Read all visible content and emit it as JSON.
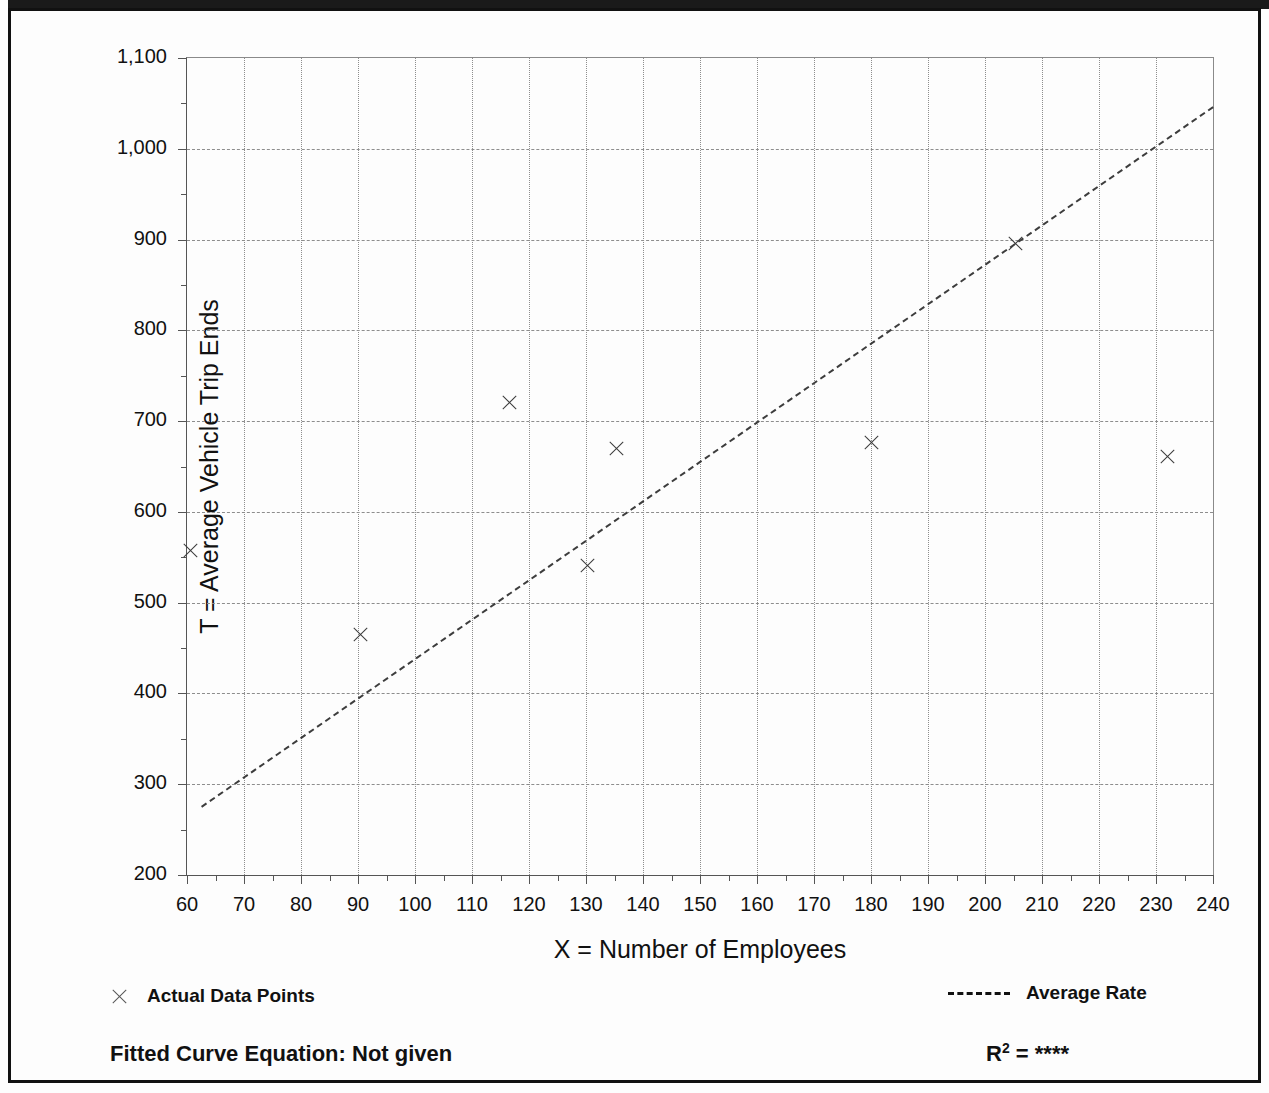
{
  "chart_data": {
    "type": "scatter",
    "title": "",
    "xlabel": "X = Number of Employees",
    "ylabel": "T = Average Vehicle Trip Ends",
    "xlim": [
      60,
      240
    ],
    "ylim": [
      200,
      1100
    ],
    "xticks": [
      60,
      70,
      80,
      90,
      100,
      110,
      120,
      130,
      140,
      150,
      160,
      170,
      180,
      190,
      200,
      210,
      220,
      230,
      240
    ],
    "yticks": [
      200,
      300,
      400,
      500,
      600,
      700,
      800,
      900,
      1000,
      1100
    ],
    "ytick_labels": [
      "200",
      "300",
      "400",
      "500",
      "600",
      "700",
      "800",
      "900",
      "1,000",
      "1,100"
    ],
    "xtick_labels": [
      "60",
      "70",
      "80",
      "90",
      "100",
      "110",
      "120",
      "130",
      "140",
      "150",
      "160",
      "170",
      "180",
      "190",
      "200",
      "210",
      "220",
      "230",
      "240"
    ],
    "y_minor_tick_step": 50,
    "x_minor_tick_step": 5,
    "grid": true,
    "grid_style": "dotted",
    "legend_position": "below-axes",
    "series": [
      {
        "name": "Actual Data Points",
        "type": "scatter",
        "marker": "x",
        "color": "#3a3a3a",
        "points": [
          {
            "x": 60.7,
            "y": 558
          },
          {
            "x": 90.5,
            "y": 466
          },
          {
            "x": 116.5,
            "y": 721
          },
          {
            "x": 130.3,
            "y": 542
          },
          {
            "x": 135.3,
            "y": 670
          },
          {
            "x": 180.0,
            "y": 677
          },
          {
            "x": 205.3,
            "y": 896
          },
          {
            "x": 232.0,
            "y": 662
          }
        ]
      },
      {
        "name": "Average Rate",
        "type": "line",
        "style": "dashed",
        "color": "#3d3d3d",
        "endpoints": [
          {
            "x": 62.5,
            "y": 276
          },
          {
            "x": 240.0,
            "y": 1047
          }
        ]
      }
    ]
  },
  "axes": {
    "y_title": "T = Average Vehicle Trip Ends",
    "x_title": "X = Number of Employees"
  },
  "legend": {
    "actual_label": "Actual Data Points",
    "average_label": "Average Rate",
    "actual_marker_icon": "x-marker-icon",
    "average_line_icon": "dashed-line-icon"
  },
  "footnotes": {
    "equation_label": "Fitted Curve Equation:  Not given",
    "rsq_symbol": "R",
    "rsq_exponent": "2",
    "rsq_equals": " = ",
    "rsq_value": "****"
  }
}
